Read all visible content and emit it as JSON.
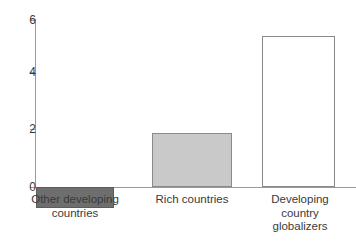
{
  "chart_data": {
    "type": "bar",
    "title": "",
    "subtitle": "",
    "xlabel": "",
    "ylabel": "",
    "categories": [
      "Other developing\ncountries",
      "Rich countries",
      "Developing\ncountry\nglobalizers"
    ],
    "values": [
      -0.75,
      1.9,
      5.3
    ],
    "ylim": [
      -1,
      6.4
    ],
    "yticks": [
      0,
      2,
      4,
      6
    ],
    "ytick_labels": [
      "0",
      "2",
      "4",
      "6"
    ],
    "grid": false,
    "legend": "none",
    "bar_colors": [
      "#6e6e6e",
      "#c9c9c9",
      "#ffffff"
    ],
    "bar_edge_colors": [
      "#5d5d5d",
      "#8a8a8a",
      "#8a8a8a"
    ],
    "axis_color": "#9a9a9a",
    "series": [
      {
        "name": "Annual per capita GDP growth (%)",
        "values": [
          -0.75,
          1.9,
          5.3
        ]
      }
    ]
  },
  "axis": {
    "tick_0": "0",
    "tick_2": "2",
    "tick_4": "4",
    "tick_6": "6"
  },
  "labels": {
    "bar1": "Other developing\ncountries",
    "bar2": "Rich countries",
    "bar3": "Developing\ncountry\nglobalizers"
  }
}
